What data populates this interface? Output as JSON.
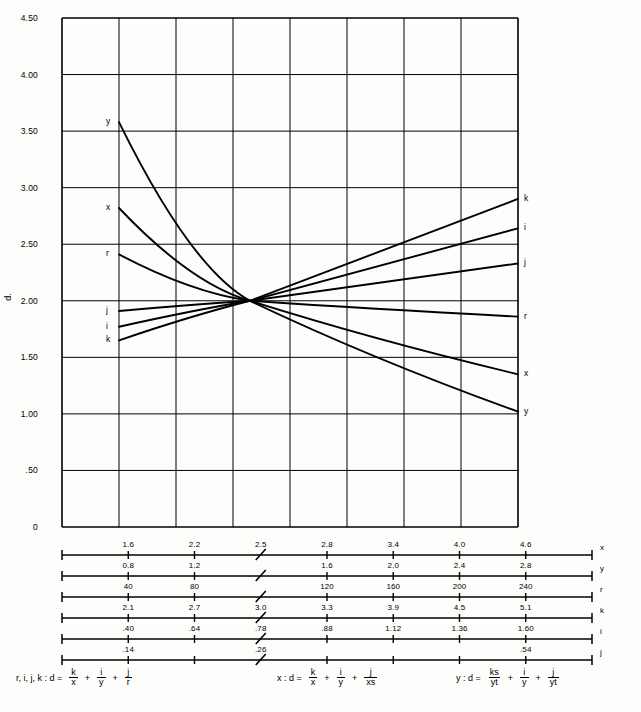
{
  "chart_data": {
    "type": "line",
    "title": "",
    "xlabel": "",
    "ylabel": "d.",
    "ylim": [
      0,
      4.5
    ],
    "grid": true,
    "legend_position": "curve-end-labels",
    "y_ticks": [
      "4.50",
      "4.00",
      "3.50",
      "3.00",
      "2.50",
      "2.00",
      "1.50",
      "1.00",
      ".50",
      "0"
    ],
    "y_tick_values": [
      4.5,
      4.0,
      3.5,
      3.0,
      2.5,
      2.0,
      1.5,
      1.0,
      0.5,
      0
    ],
    "x_gridline_count": 7,
    "convergence_value": 2.0,
    "series": [
      {
        "name": "y",
        "left_label": "y",
        "right_label": "y",
        "start": 3.58,
        "end": 1.02,
        "curved": true
      },
      {
        "name": "x",
        "left_label": "x",
        "right_label": "x",
        "start": 2.82,
        "end": 1.35,
        "curved": true
      },
      {
        "name": "r",
        "left_label": "r",
        "right_label": "r",
        "start": 2.41,
        "end": 1.86,
        "curved": true
      },
      {
        "name": "j",
        "left_label": "j",
        "right_label": "j",
        "start": 1.91,
        "end": 2.33,
        "curved": false
      },
      {
        "name": "i",
        "left_label": "i",
        "right_label": "i",
        "start": 1.77,
        "end": 2.64,
        "curved": false
      },
      {
        "name": "k",
        "left_label": "k",
        "right_label": "k",
        "start": 1.65,
        "end": 2.9,
        "curved": false
      }
    ]
  },
  "axis": {
    "y_title": "d.",
    "y_labels": [
      "4.50",
      "4.00",
      "3.50",
      "3.00",
      "2.50",
      "2.00",
      "1.50",
      "1.00",
      ".50",
      "0"
    ]
  },
  "curve_labels": {
    "left": [
      "y",
      "x",
      "r",
      "j",
      "i",
      "k"
    ],
    "right": [
      "k",
      "i",
      "j",
      "r",
      "x",
      "y"
    ]
  },
  "scales": [
    {
      "name": "x",
      "row_label": "x",
      "ticks": [
        "1.6",
        "2.2",
        "2.5",
        "2.8",
        "3.4",
        "4.0",
        "4.6"
      ],
      "break_after": 2
    },
    {
      "name": "y",
      "row_label": "y",
      "ticks": [
        "0.8",
        "1.2",
        "",
        "1.6",
        "2.0",
        "2.4",
        "2.8"
      ],
      "break_after": 2
    },
    {
      "name": "r",
      "row_label": "r",
      "ticks": [
        "40",
        "80",
        "",
        "120",
        "160",
        "200",
        "240"
      ],
      "break_after": 2
    },
    {
      "name": "k",
      "row_label": "k",
      "ticks": [
        "2.1",
        "2.7",
        "3.0",
        "3.3",
        "3.9",
        "4.5",
        "5.1"
      ],
      "break_after": 2
    },
    {
      "name": "i",
      "row_label": "i",
      "ticks": [
        ".40",
        ".64",
        ".78",
        ".88",
        "1.12",
        "1.36",
        "1.60"
      ],
      "break_after": 2
    },
    {
      "name": "j",
      "row_label": "j",
      "ticks": [
        ".14",
        "",
        ".26",
        "",
        "",
        "",
        ".54"
      ],
      "break_after": 2
    }
  ],
  "formulas": [
    {
      "lead": "r, i, j, k  :  d =",
      "terms": [
        {
          "num": "k",
          "den": "x"
        },
        {
          "num": "i",
          "den": "y"
        },
        {
          "num": "j",
          "den": "r"
        }
      ]
    },
    {
      "lead": "x  :  d =",
      "terms": [
        {
          "num": "k",
          "den": "x"
        },
        {
          "num": "i",
          "den": "y"
        },
        {
          "num": "j",
          "den": "xs"
        }
      ]
    },
    {
      "lead": "y  :  d =",
      "terms": [
        {
          "num": "ks",
          "den": "yt"
        },
        {
          "num": "i",
          "den": "y"
        },
        {
          "num": "j",
          "den": "yt"
        }
      ]
    }
  ],
  "formula_operator": "+"
}
